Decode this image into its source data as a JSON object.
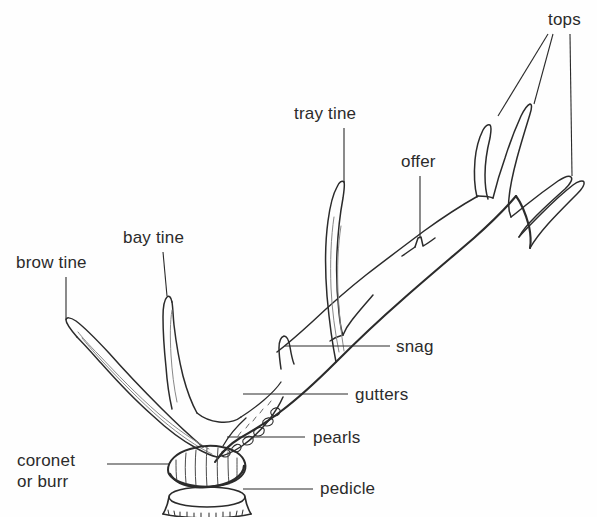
{
  "diagram": {
    "background_color": "#fefefe",
    "line_color": "#2b2b2b",
    "text_color": "#2b2b2b",
    "labels": [
      {
        "id": "tops",
        "text": "tops",
        "x": 548,
        "y": 10,
        "leaders": 3
      },
      {
        "id": "tray-tine",
        "text": "tray tine",
        "x": 294,
        "y": 104,
        "leaders": 1
      },
      {
        "id": "offer",
        "text": "offer",
        "x": 401,
        "y": 152,
        "leaders": 1
      },
      {
        "id": "bay-tine",
        "text": "bay tine",
        "x": 123,
        "y": 228,
        "leaders": 1
      },
      {
        "id": "brow-tine",
        "text": "brow tine",
        "x": 16,
        "y": 253,
        "leaders": 1
      },
      {
        "id": "snag",
        "text": "snag",
        "x": 396,
        "y": 337,
        "leaders": 1
      },
      {
        "id": "gutters",
        "text": "gutters",
        "x": 355,
        "y": 385,
        "leaders": 1
      },
      {
        "id": "pearls",
        "text": "pearls",
        "x": 313,
        "y": 428,
        "leaders": 1
      },
      {
        "id": "coronet",
        "text": "coronet\nor burr",
        "x": 17,
        "y": 450,
        "leaders": 1
      },
      {
        "id": "pedicle",
        "text": "pedicle",
        "x": 320,
        "y": 479,
        "leaders": 1
      }
    ],
    "parts": [
      "tops",
      "tray tine",
      "offer",
      "bay tine",
      "brow tine",
      "snag",
      "gutters",
      "pearls",
      "coronet or burr",
      "pedicle"
    ]
  }
}
